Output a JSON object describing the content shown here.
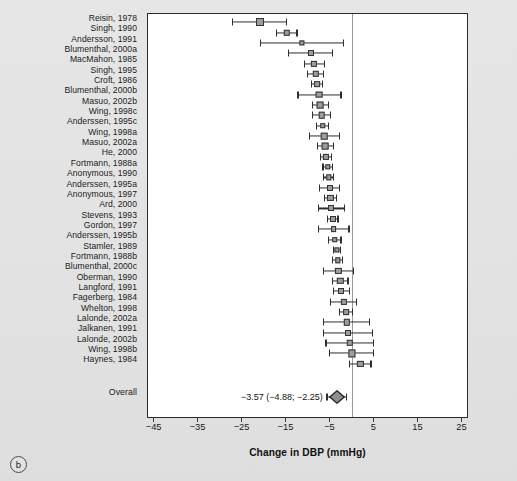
{
  "figure": {
    "panel_letter": "b",
    "x_axis": {
      "title": "Change in DBP (mmHg)",
      "ticks": [
        -45,
        -35,
        -25,
        -15,
        -5,
        5,
        15,
        25
      ],
      "tick_labels": [
        "−45",
        "−35",
        "−25",
        "−15",
        "−5",
        "5",
        "15",
        "25"
      ],
      "min": -46.5,
      "max": 26.5
    },
    "reference_line": 0,
    "overall_label": "Overall",
    "overall_text": "−3.57 (−4.88; −2.25)"
  },
  "chart_data": {
    "type": "forest",
    "title": "",
    "xlabel": "Change in DBP (mmHg)",
    "ylabel": "",
    "xlim": [
      -46.5,
      26.5
    ],
    "grid": false,
    "legend": "none",
    "effect_measure": "Change in DBP (mmHg)",
    "reference_line": 0,
    "studies": [
      {
        "label": "Reisin, 1978",
        "estimate": -21.0,
        "ci_low": -27.2,
        "ci_high": -15.0,
        "box": 8.0
      },
      {
        "label": "Singh, 1990",
        "estimate": -15.0,
        "ci_low": -17.3,
        "ci_high": -12.6,
        "box": 6.4
      },
      {
        "label": "Andersson, 1991",
        "estimate": -11.5,
        "ci_low": -21.0,
        "ci_high": -2.0,
        "box": 5.2
      },
      {
        "label": "Blumenthal, 2000a",
        "estimate": -9.5,
        "ci_low": -14.5,
        "ci_high": -4.5,
        "box": 6.0
      },
      {
        "label": "MacMahon, 1985",
        "estimate": -8.7,
        "ci_low": -11.0,
        "ci_high": -6.4,
        "box": 6.2
      },
      {
        "label": "Singh, 1995",
        "estimate": -8.4,
        "ci_low": -10.2,
        "ci_high": -6.6,
        "box": 6.4
      },
      {
        "label": "Croft, 1986",
        "estimate": -8.1,
        "ci_low": -9.3,
        "ci_high": -6.9,
        "box": 5.8
      },
      {
        "label": "Blumenthal, 2000b",
        "estimate": -7.5,
        "ci_low": -12.4,
        "ci_high": -2.6,
        "box": 6.8
      },
      {
        "label": "Masuo, 2002b",
        "estimate": -7.3,
        "ci_low": -9.1,
        "ci_high": -5.5,
        "box": 6.8
      },
      {
        "label": "Wing, 1998c",
        "estimate": -7.0,
        "ci_low": -9.0,
        "ci_high": -5.0,
        "box": 6.6
      },
      {
        "label": "Anderssen, 1995c",
        "estimate": -6.8,
        "ci_low": -8.2,
        "ci_high": -5.4,
        "box": 5.6
      },
      {
        "label": "Wing, 1998a",
        "estimate": -6.4,
        "ci_low": -9.8,
        "ci_high": -3.0,
        "box": 6.6
      },
      {
        "label": "Masuo, 2002a",
        "estimate": -6.2,
        "ci_low": -8.0,
        "ci_high": -4.4,
        "box": 6.8
      },
      {
        "label": "He, 2000",
        "estimate": -6.0,
        "ci_low": -7.3,
        "ci_high": -4.7,
        "box": 6.2
      },
      {
        "label": "Fortmann, 1988a",
        "estimate": -5.6,
        "ci_low": -6.7,
        "ci_high": -4.5,
        "box": 5.4
      },
      {
        "label": "Anonymous, 1990",
        "estimate": -5.4,
        "ci_low": -6.5,
        "ci_high": -4.3,
        "box": 5.4
      },
      {
        "label": "Anderssen, 1995a",
        "estimate": -5.2,
        "ci_low": -7.5,
        "ci_high": -2.9,
        "box": 6.0
      },
      {
        "label": "Anonymous, 1997",
        "estimate": -5.0,
        "ci_low": -6.4,
        "ci_high": -3.6,
        "box": 6.2
      },
      {
        "label": "Ard, 2000",
        "estimate": -4.8,
        "ci_low": -7.8,
        "ci_high": -1.8,
        "box": 6.0
      },
      {
        "label": "Stevens, 1993",
        "estimate": -4.5,
        "ci_low": -5.7,
        "ci_high": -3.3,
        "box": 6.0
      },
      {
        "label": "Gordon, 1997",
        "estimate": -4.3,
        "ci_low": -7.8,
        "ci_high": -0.8,
        "box": 5.8
      },
      {
        "label": "Anderssen, 1995b",
        "estimate": -4.0,
        "ci_low": -5.4,
        "ci_high": -2.6,
        "box": 5.6
      },
      {
        "label": "Stamler, 1989",
        "estimate": -3.6,
        "ci_low": -4.4,
        "ci_high": -2.8,
        "box": 5.2
      },
      {
        "label": "Fortmann, 1988b",
        "estimate": -3.4,
        "ci_low": -4.6,
        "ci_high": -2.2,
        "box": 5.4
      },
      {
        "label": "Blumenthal, 2000c",
        "estimate": -3.2,
        "ci_low": -6.6,
        "ci_high": 0.2,
        "box": 6.2
      },
      {
        "label": "Oberman, 1990",
        "estimate": -2.8,
        "ci_low": -4.6,
        "ci_high": -1.0,
        "box": 6.4
      },
      {
        "label": "Langford, 1991",
        "estimate": -2.5,
        "ci_low": -4.4,
        "ci_high": -0.6,
        "box": 6.0
      },
      {
        "label": "Fagerberg, 1984",
        "estimate": -2.0,
        "ci_low": -5.0,
        "ci_high": 1.0,
        "box": 6.2
      },
      {
        "label": "Whelton, 1998",
        "estimate": -1.5,
        "ci_low": -3.0,
        "ci_high": 0.0,
        "box": 5.8
      },
      {
        "label": "Lalonde, 2002a",
        "estimate": -1.3,
        "ci_low": -6.5,
        "ci_high": 3.9,
        "box": 6.4
      },
      {
        "label": "Jalkanen, 1991",
        "estimate": -1.0,
        "ci_low": -6.5,
        "ci_high": 4.5,
        "box": 6.0
      },
      {
        "label": "Lalonde, 2002b",
        "estimate": -0.6,
        "ci_low": -6.0,
        "ci_high": 4.8,
        "box": 6.4
      },
      {
        "label": "Wing, 1998b",
        "estimate": -0.2,
        "ci_low": -5.2,
        "ci_high": 4.8,
        "box": 7.2
      },
      {
        "label": "Haynes, 1984",
        "estimate": 1.8,
        "ci_low": -0.6,
        "ci_high": 4.2,
        "box": 6.2
      }
    ],
    "overall": {
      "label": "Overall",
      "estimate": -3.57,
      "ci_low": -4.88,
      "ci_high": -2.25,
      "text": "−3.57 (−4.88; −2.25)"
    }
  }
}
